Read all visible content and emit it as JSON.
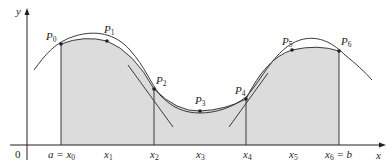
{
  "figure": {
    "type": "simpson-rule-illustration",
    "colors": {
      "shade": "#dcdcdc",
      "curve": "#3a3a3a",
      "axis": "#231f20",
      "point": "#231f20"
    },
    "axes": {
      "x_label": "x",
      "y_label": "y",
      "origin_label": "0"
    },
    "x_ticks": [
      {
        "main": "a = x",
        "sub": "0",
        "px": 61
      },
      {
        "main": "x",
        "sub": "1",
        "px": 107
      },
      {
        "main": "x",
        "sub": "2",
        "px": 154
      },
      {
        "main": "x",
        "sub": "3",
        "px": 200
      },
      {
        "main": "x",
        "sub": "4",
        "px": 246
      },
      {
        "main": "x",
        "sub": "5",
        "px": 292
      },
      {
        "main": "x",
        "sub": "6",
        "suffix": " = b",
        "px": 339
      }
    ],
    "points": [
      {
        "name": "P",
        "sub": "0",
        "px": 61,
        "py": 44
      },
      {
        "name": "P",
        "sub": "1",
        "px": 107,
        "py": 41
      },
      {
        "name": "P",
        "sub": "2",
        "px": 154,
        "py": 89
      },
      {
        "name": "P",
        "sub": "3",
        "px": 200,
        "py": 111
      },
      {
        "name": "P",
        "sub": "4",
        "px": 246,
        "py": 99
      },
      {
        "name": "P",
        "sub": "5",
        "px": 292,
        "py": 50
      },
      {
        "name": "P",
        "sub": "6",
        "px": 339,
        "py": 51
      }
    ]
  }
}
